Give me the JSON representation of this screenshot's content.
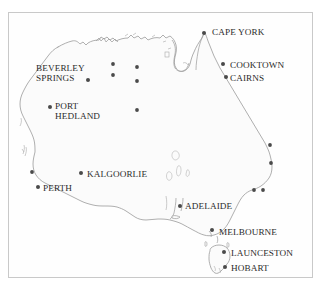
{
  "figure": {
    "kind": "map",
    "region": "Australia",
    "frame_color": "#c9c9c9",
    "land_fill": "#fbfbfb",
    "coast_stroke": "#9a9a9a",
    "dot_color": "#4a4a4a",
    "label_color": "#2b2b2b",
    "background": "#ffffff"
  },
  "labels": [
    {
      "text": "CAPE YORK",
      "x": 212,
      "y": 27
    },
    {
      "text": "COOKTOWN",
      "x": 230,
      "y": 60
    },
    {
      "text": "CAIRNS",
      "x": 230,
      "y": 73
    },
    {
      "text": "BEVERLEY",
      "x": 36,
      "y": 63
    },
    {
      "text": "SPRINGS",
      "x": 36,
      "y": 73
    },
    {
      "text": "PORT",
      "x": 55,
      "y": 101
    },
    {
      "text": "HEDLAND",
      "x": 55,
      "y": 111
    },
    {
      "text": "KALGOORLIE",
      "x": 87,
      "y": 169
    },
    {
      "text": "PERTH",
      "x": 43,
      "y": 183
    },
    {
      "text": "ADELAIDE",
      "x": 185,
      "y": 201
    },
    {
      "text": "MELBOURNE",
      "x": 219,
      "y": 227
    },
    {
      "text": "LAUNCESTON",
      "x": 231,
      "y": 248
    },
    {
      "text": "HOBART",
      "x": 231,
      "y": 263
    }
  ],
  "city_dots": [
    {
      "name": "cape-york",
      "x": 204,
      "y": 33
    },
    {
      "name": "cooktown",
      "x": 223,
      "y": 64
    },
    {
      "name": "cairns",
      "x": 226,
      "y": 77
    },
    {
      "name": "beverley-springs",
      "x": 88,
      "y": 80
    },
    {
      "name": "port-hedland",
      "x": 50,
      "y": 107
    },
    {
      "name": "kalgoorlie",
      "x": 81,
      "y": 173
    },
    {
      "name": "perth",
      "x": 38,
      "y": 187
    },
    {
      "name": "adelaide",
      "x": 180,
      "y": 206
    },
    {
      "name": "melbourne",
      "x": 212,
      "y": 230
    },
    {
      "name": "launceston",
      "x": 224,
      "y": 252
    },
    {
      "name": "hobart",
      "x": 225,
      "y": 267
    }
  ],
  "unlabelled_dots": [
    {
      "name": "dot-kimberley-north",
      "x": 113,
      "y": 64
    },
    {
      "name": "dot-kimberley-south",
      "x": 113,
      "y": 75
    },
    {
      "name": "dot-top-end",
      "x": 137,
      "y": 67
    },
    {
      "name": "dot-tanami",
      "x": 137,
      "y": 81
    },
    {
      "name": "dot-alice",
      "x": 137,
      "y": 110
    },
    {
      "name": "dot-coral-coast",
      "x": 32,
      "y": 172
    },
    {
      "name": "dot-qld-central",
      "x": 270,
      "y": 145
    },
    {
      "name": "dot-qld-south",
      "x": 271,
      "y": 163
    },
    {
      "name": "dot-nsw-west",
      "x": 254,
      "y": 190
    },
    {
      "name": "dot-nsw-east",
      "x": 263,
      "y": 190
    }
  ]
}
